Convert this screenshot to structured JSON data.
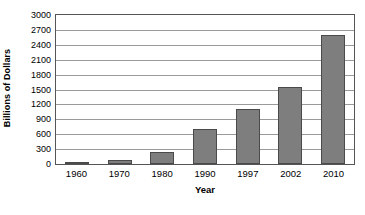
{
  "chart_data": {
    "type": "bar",
    "title": "",
    "xlabel": "Year",
    "ylabel": "Billions of Dollars",
    "categories": [
      "1960",
      "1970",
      "1980",
      "1990",
      "1997",
      "2002",
      "2010"
    ],
    "values": [
      30,
      80,
      250,
      700,
      1100,
      1550,
      2600
    ],
    "ylim": [
      0,
      3000
    ],
    "ytick_values": [
      0,
      300,
      600,
      900,
      1200,
      1500,
      1800,
      2100,
      2400,
      2700,
      3000
    ],
    "ytick_labels": [
      "0",
      "300",
      "600",
      "900",
      "1200",
      "1500",
      "1800",
      "2100",
      "2400",
      "2700",
      "3000"
    ],
    "grid": true,
    "legend": false,
    "legend_position": "none",
    "colors": {
      "bar_fill": "#7e7e7e",
      "bar_border": "#4a4a4a",
      "gridline": "#9a9a9a",
      "plot_border": "#555555",
      "background": "#ffffff",
      "text": "#000000"
    }
  }
}
